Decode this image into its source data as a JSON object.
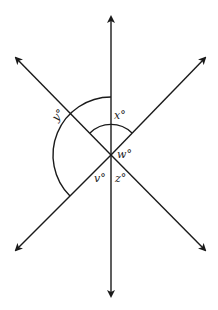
{
  "diagram": {
    "type": "intersecting-lines-angles",
    "center": {
      "x": 111,
      "y": 155
    },
    "lines": [
      {
        "name": "vertical",
        "x1": 111,
        "y1": 296,
        "x2": 111,
        "y2": 16,
        "arrows": "both"
      },
      {
        "name": "diagonal-nw-se",
        "x1": 15,
        "y1": 58,
        "x2": 206,
        "y2": 251,
        "arrows": "both"
      },
      {
        "name": "diagonal-ne-sw",
        "x1": 206,
        "y1": 58,
        "x2": 15,
        "y2": 251,
        "arrows": "both"
      }
    ],
    "labels": {
      "x": "x°",
      "y": "y°",
      "w": "w°",
      "v": "v°",
      "z": "z°"
    },
    "colors": {
      "stroke": "#1a1a1a",
      "text": "#222222",
      "background": "#ffffff"
    }
  }
}
